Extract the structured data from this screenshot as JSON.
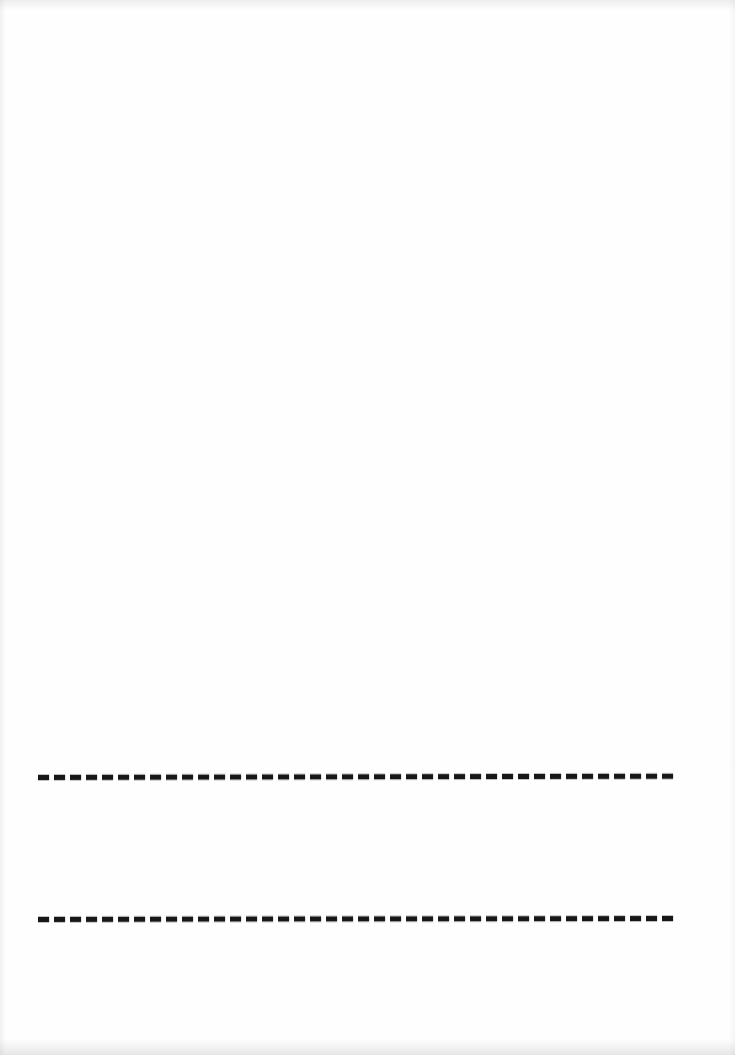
{
  "page": {
    "name": "scanned-blank-form-page",
    "width": 735,
    "height": 1055,
    "background_color": "#fefefe",
    "ink_color": "#171717",
    "visible_text": "",
    "note": ""
  },
  "blank_area": {
    "label": ""
  },
  "rules": [
    {
      "id": "rule-1",
      "label": "",
      "style": "dashed",
      "color": "#171717",
      "x_start": 38,
      "x_end": 675,
      "y": 778,
      "thickness": 5,
      "dash_length": 11,
      "dash_gap": 5
    },
    {
      "id": "rule-2",
      "label": "",
      "style": "dashed",
      "color": "#171717",
      "x_start": 38,
      "x_end": 678,
      "y": 920,
      "thickness": 5,
      "dash_length": 11,
      "dash_gap": 5
    }
  ],
  "scan_artifacts": {
    "top_edge": "",
    "bottom_edge": "",
    "left_edge": "",
    "right_edge": ""
  }
}
